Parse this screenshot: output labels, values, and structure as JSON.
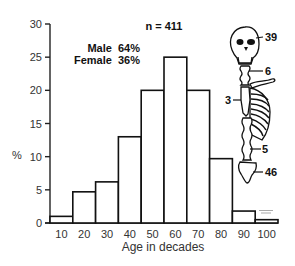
{
  "chart_data": {
    "type": "bar",
    "title": "",
    "xlabel": "Age in decades",
    "ylabel": "%",
    "ylim": [
      0,
      30
    ],
    "yticks": [
      0,
      5,
      10,
      15,
      20,
      25,
      30
    ],
    "categories": [
      "10",
      "20",
      "30",
      "40",
      "50",
      "60",
      "70",
      "80",
      "90",
      "100"
    ],
    "values": [
      1,
      4.7,
      6.2,
      13,
      20,
      25,
      20,
      9.7,
      1.8,
      0.5
    ],
    "grid": false,
    "annotations": {
      "n": "n = 411",
      "male": "Male  64%",
      "female": "Female  36%"
    },
    "skeleton_labels": {
      "skull": "39",
      "cervical_spine": "6",
      "thoracic_spine": "3",
      "lumbar_spine": "5",
      "sacrum_pelvis": "46"
    }
  }
}
